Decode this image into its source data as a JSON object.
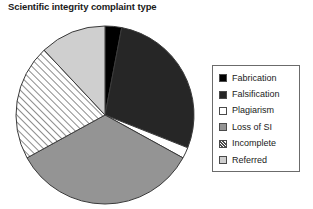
{
  "chart_data": {
    "type": "pie",
    "title": "Scientific integrity complaint type",
    "xlabel": "",
    "ylabel": "",
    "grid": false,
    "legend_position": "right",
    "categories": [
      "Fabrication",
      "Falsification",
      "Plagiarism",
      "Loss of SI",
      "Incomplete",
      "Referred"
    ],
    "values": [
      3,
      28,
      2,
      34,
      21,
      12
    ],
    "units": "percent",
    "start_angle_deg": 0,
    "direction": "clockwise",
    "slices": [
      {
        "label": "Fabrication",
        "value": 3,
        "fill": "#000000",
        "pattern": "solid",
        "start_deg": 0,
        "end_deg": 10.8
      },
      {
        "label": "Falsification",
        "value": 28,
        "fill": "#262626",
        "pattern": "solid",
        "start_deg": 10.8,
        "end_deg": 111.6
      },
      {
        "label": "Plagiarism",
        "value": 2,
        "fill": "#ffffff",
        "pattern": "solid",
        "start_deg": 111.6,
        "end_deg": 118.8
      },
      {
        "label": "Loss of SI",
        "value": 34,
        "fill": "#949494",
        "pattern": "solid",
        "start_deg": 118.8,
        "end_deg": 241.2
      },
      {
        "label": "Incomplete",
        "value": 21,
        "fill": "#ffffff",
        "pattern": "diagonal-hatch",
        "start_deg": 241.2,
        "end_deg": 316.8
      },
      {
        "label": "Referred",
        "value": 12,
        "fill": "#cfcfcf",
        "pattern": "solid",
        "start_deg": 316.8,
        "end_deg": 360
      }
    ]
  },
  "legend": {
    "items": [
      {
        "label": "Fabrication",
        "swatch_name": "legend-swatch-fabrication",
        "fill": "#000000",
        "pattern": "solid"
      },
      {
        "label": "Falsification",
        "swatch_name": "legend-swatch-falsification",
        "fill": "#262626",
        "pattern": "solid"
      },
      {
        "label": "Plagiarism",
        "swatch_name": "legend-swatch-plagiarism",
        "fill": "#ffffff",
        "pattern": "solid"
      },
      {
        "label": "Loss of SI",
        "swatch_name": "legend-swatch-loss-of-si",
        "fill": "#949494",
        "pattern": "solid"
      },
      {
        "label": "Incomplete",
        "swatch_name": "legend-swatch-incomplete",
        "fill": "#ffffff",
        "pattern": "diagonal-hatch"
      },
      {
        "label": "Referred",
        "swatch_name": "legend-swatch-referred",
        "fill": "#cfcfcf",
        "pattern": "solid"
      }
    ]
  },
  "colors": {
    "outline": "#3a3a3a",
    "legend_border": "#6b6b6b",
    "text": "#1a1a1a",
    "background": "#ffffff"
  }
}
